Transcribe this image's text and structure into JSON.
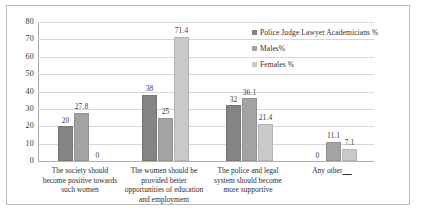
{
  "chart_data": {
    "type": "bar",
    "title": "",
    "xlabel": "",
    "ylabel": "",
    "ylim": [
      0,
      80
    ],
    "yticks": [
      "0",
      "10",
      "20",
      "30",
      "40",
      "50",
      "60",
      "70",
      "80"
    ],
    "grid": true,
    "legend_position": "top-right",
    "categories": [
      "The society should become positive towards such women",
      "The women should be provided better opportunities of education and employment",
      "The police and legal system should become more supportive",
      "Any other____"
    ],
    "category_lines": [
      [
        "The society should",
        "become positive towards",
        "such women"
      ],
      [
        "The women should be",
        "provided better",
        "opportunities of education",
        "and employment"
      ],
      [
        "The police and legal",
        "system should become",
        "more supportive"
      ],
      [
        "Any other____"
      ]
    ],
    "series": [
      {
        "name": "Police Judge Lawyer Academicians %",
        "color": "#848484",
        "values": [
          20,
          38,
          32,
          0
        ]
      },
      {
        "name": "Males%",
        "color": "#a3a3a3",
        "values": [
          27.8,
          25,
          36.1,
          11.1
        ]
      },
      {
        "name": "Females %",
        "color": "#c9c9c9",
        "values": [
          0,
          71.4,
          21.4,
          7.1
        ]
      }
    ],
    "data_labels": [
      [
        "20",
        "38",
        "32",
        "0"
      ],
      [
        "27.8",
        "25",
        "36.1",
        "11.1"
      ],
      [
        "0",
        "71.4",
        "21.4",
        "7.1"
      ]
    ]
  },
  "legend": {
    "items": [
      {
        "label": "Police Judge Lawyer Academicians %"
      },
      {
        "label": "Males%"
      },
      {
        "label": "Females %"
      }
    ]
  }
}
